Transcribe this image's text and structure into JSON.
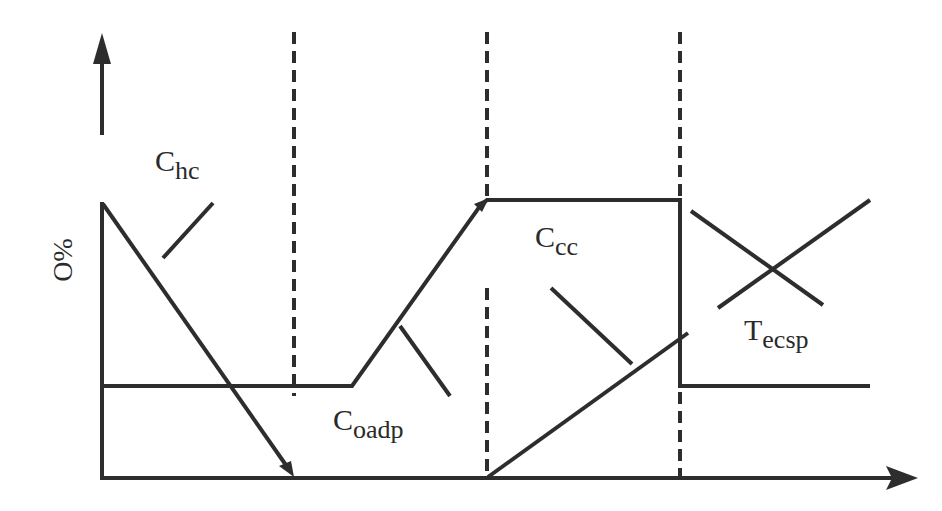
{
  "diagram": {
    "y_axis_label": "%O",
    "colors": {
      "line": "#2d2d2d",
      "background": "#ffffff"
    },
    "labels": [
      {
        "id": "chc",
        "main": "C",
        "sub": "hc"
      },
      {
        "id": "coadp",
        "main": "C",
        "sub": "oadp"
      },
      {
        "id": "ccc",
        "main": "C",
        "sub": "cc"
      },
      {
        "id": "tecsp",
        "main": "T",
        "sub": "ecsp"
      }
    ],
    "phase_boundaries_x": [
      294,
      487,
      680
    ]
  }
}
